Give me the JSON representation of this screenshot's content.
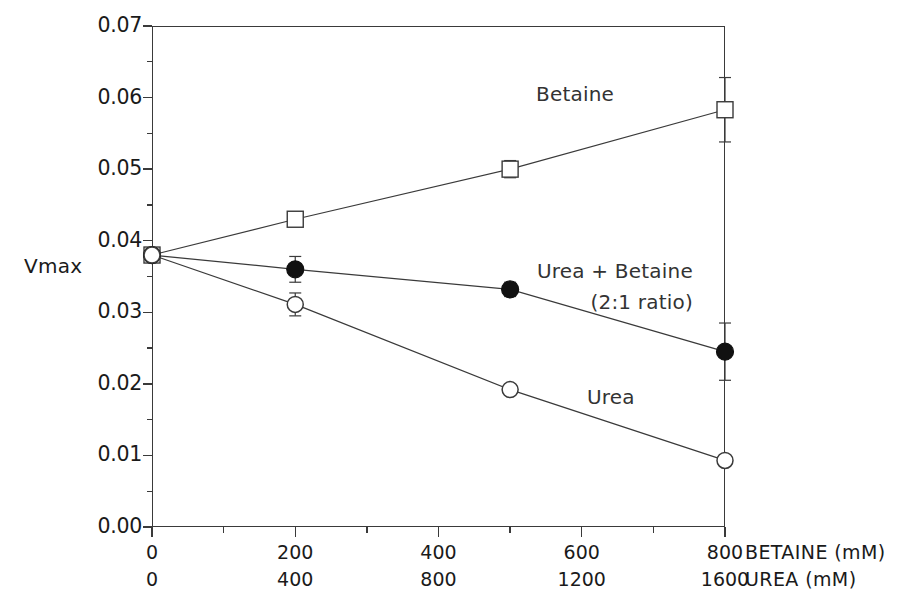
{
  "figure": {
    "y_axis_name": "Vmax",
    "x_axis_titles": {
      "primary": "BETAINE (mM)",
      "secondary": "UREA (mM)"
    }
  },
  "annotations": {
    "betaine": "Betaine",
    "urea_betaine_line1": "Urea + Betaine",
    "urea_betaine_line2": "(2:1 ratio)",
    "urea": "Urea"
  },
  "axis": {
    "y_ticks": [
      "0.00",
      "0.01",
      "0.02",
      "0.03",
      "0.04",
      "0.05",
      "0.06",
      "0.07"
    ],
    "x_ticks_betaine": [
      "0",
      "200",
      "400",
      "600",
      "800"
    ],
    "x_ticks_urea": [
      "0",
      "400",
      "800",
      "1200",
      "1600"
    ]
  },
  "chart_data": {
    "type": "line",
    "title": "",
    "xlabel": "BETAINE (mM)",
    "xlabel_secondary": "UREA (mM)",
    "ylabel": "Vmax",
    "xlim": [
      0,
      800
    ],
    "xlim_secondary": [
      0,
      1600
    ],
    "ylim": [
      0.0,
      0.07
    ],
    "y_major_tick_interval": 0.01,
    "y_minor_tick_interval": 0.005,
    "x_major_tick_interval": 200,
    "x_minor_tick_interval": 100,
    "grid": false,
    "legend_position": "inline-annotations",
    "x": [
      0,
      200,
      500,
      800
    ],
    "x_urea_equivalent": [
      0,
      400,
      1000,
      1600
    ],
    "series": [
      {
        "name": "Betaine",
        "marker": "open-square",
        "values": [
          0.038,
          0.043,
          0.05,
          0.0583
        ],
        "errors": [
          0.0006,
          0.001,
          0.0012,
          0.0045
        ]
      },
      {
        "name": "Urea + Betaine (2:1 ratio)",
        "marker": "filled-circle",
        "values": [
          0.038,
          0.036,
          0.0332,
          0.0245
        ],
        "errors": [
          0.0006,
          0.0018,
          0.001,
          0.004
        ]
      },
      {
        "name": "Urea",
        "marker": "open-circle",
        "values": [
          0.038,
          0.0311,
          0.0192,
          0.0093
        ],
        "errors": [
          0.0006,
          0.0016,
          0.0004,
          0.0004
        ]
      }
    ]
  }
}
